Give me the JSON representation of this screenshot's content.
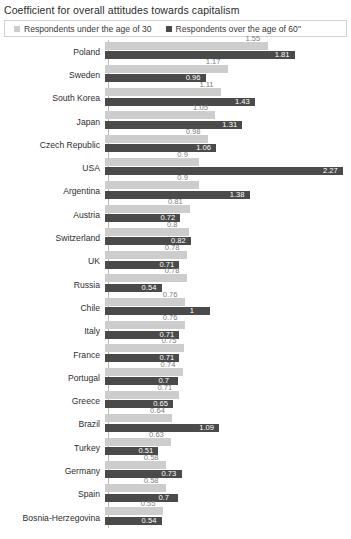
{
  "chart_data": {
    "type": "bar",
    "orientation": "horizontal",
    "title": "Coefficient for overall attitudes towards capitalism",
    "xlabel": "",
    "ylabel": "",
    "grid": false,
    "legend_position": "top",
    "xlim": [
      0,
      2.27
    ],
    "colors": {
      "under30": "#cdcdcd",
      "over60": "#4a4a4a"
    },
    "categories": [
      "Poland",
      "Sweden",
      "South Korea",
      "Japan",
      "Czech Republic",
      "USA",
      "Argentina",
      "Austria",
      "Switzerland",
      "UK",
      "Russia",
      "Chile",
      "Italy",
      "France",
      "Portugal",
      "Greece",
      "Brazil",
      "Turkey",
      "Germany",
      "Spain",
      "Bosnia-Herzegovina"
    ],
    "series": [
      {
        "name": "Respondents under the age of 30",
        "color": "#cdcdcd",
        "values": [
          1.55,
          1.17,
          1.11,
          1.05,
          0.98,
          0.9,
          0.9,
          0.81,
          0.8,
          0.78,
          0.78,
          0.76,
          0.76,
          0.75,
          0.74,
          0.71,
          0.64,
          0.63,
          0.58,
          0.58,
          0.55
        ],
        "labels": [
          "1.55",
          "1.17",
          "1.11",
          "1.05",
          "0.98",
          "0.9",
          "0.9",
          "0.81",
          "0.8",
          "0.78",
          "0.78",
          "0.76",
          "0.76",
          "0.75",
          "0.74",
          "0.71",
          "0.64",
          "0.63",
          "0.58",
          "0.58",
          "0.55"
        ]
      },
      {
        "name": "Respondents over the age of 60\"",
        "color": "#4a4a4a",
        "values": [
          1.81,
          0.96,
          1.43,
          1.31,
          1.06,
          2.27,
          1.38,
          0.72,
          0.82,
          0.71,
          0.54,
          1,
          0.71,
          0.71,
          0.7,
          0.65,
          1.09,
          0.51,
          0.73,
          0.7,
          0.54
        ],
        "labels": [
          "1.81",
          "0.96",
          "1.43",
          "1.31",
          "1.06",
          "2.27",
          "1.38",
          "0.72",
          "0.82",
          "0.71",
          "0.54",
          "1",
          "0.71",
          "0.71",
          "0.7",
          "0.65",
          "1.09",
          "0.51",
          "0.73",
          "0.7",
          "0.54"
        ]
      }
    ]
  },
  "legend": {
    "items": [
      {
        "label": "Respondents under the age of 30",
        "color": "#cdcdcd"
      },
      {
        "label": "Respondents over the age of 60\"",
        "color": "#4a4a4a"
      }
    ]
  }
}
